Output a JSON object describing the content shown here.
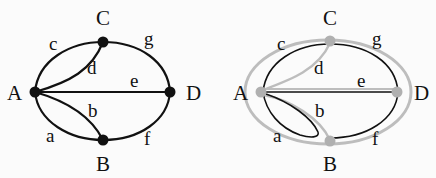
{
  "graphs": [
    {
      "name": "original-graph",
      "nodes": [
        {
          "id": "A",
          "label": "A"
        },
        {
          "id": "B",
          "label": "B"
        },
        {
          "id": "C",
          "label": "C"
        },
        {
          "id": "D",
          "label": "D"
        }
      ],
      "edges": [
        {
          "id": "a",
          "label": "a",
          "from": "A",
          "to": "B"
        },
        {
          "id": "b",
          "label": "b",
          "from": "A",
          "to": "B"
        },
        {
          "id": "c",
          "label": "c",
          "from": "A",
          "to": "C"
        },
        {
          "id": "d",
          "label": "d",
          "from": "A",
          "to": "C"
        },
        {
          "id": "e",
          "label": "e",
          "from": "A",
          "to": "D"
        },
        {
          "id": "f",
          "label": "f",
          "from": "B",
          "to": "D"
        },
        {
          "id": "g",
          "label": "g",
          "from": "C",
          "to": "D"
        }
      ],
      "node_color": "#111111",
      "edge_color": "#111111"
    },
    {
      "name": "traced-graph",
      "nodes": [
        {
          "id": "A",
          "label": "A"
        },
        {
          "id": "B",
          "label": "B"
        },
        {
          "id": "C",
          "label": "C"
        },
        {
          "id": "D",
          "label": "D"
        }
      ],
      "edges": [
        {
          "id": "a",
          "label": "a"
        },
        {
          "id": "b",
          "label": "b"
        },
        {
          "id": "c",
          "label": "c"
        },
        {
          "id": "d",
          "label": "d"
        },
        {
          "id": "e",
          "label": "e"
        },
        {
          "id": "f",
          "label": "f"
        },
        {
          "id": "g",
          "label": "g"
        }
      ],
      "node_color": "#b0b0b0",
      "edge_color": "#111111",
      "trace_color": "#b8b8b8"
    }
  ]
}
